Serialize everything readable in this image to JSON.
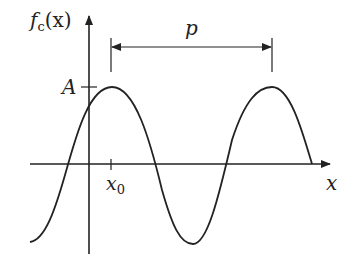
{
  "diagram": {
    "type": "periodic-function-plot",
    "y_axis_label": "f",
    "y_axis_label_sub": "c",
    "y_axis_label_arg": "(x)",
    "x_axis_label": "x",
    "amplitude_label": "A",
    "x0_label": "x",
    "x0_sub": "0",
    "period_label": "p",
    "colors": {
      "stroke": "#222222",
      "background": "#ffffff"
    }
  }
}
